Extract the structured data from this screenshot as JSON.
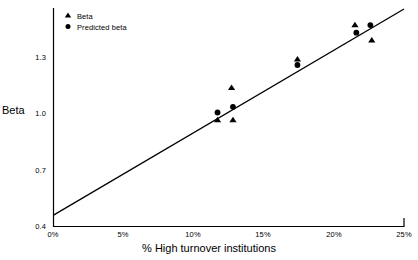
{
  "chart_data": {
    "type": "scatter",
    "title": "",
    "xlabel": "% High turnover institutions",
    "ylabel": "Beta",
    "xlim": [
      0,
      25
    ],
    "ylim": [
      0.4,
      1.55
    ],
    "grid": false,
    "legend_position": "top-left",
    "x_tick_labels": [
      "0%",
      "5%",
      "10%",
      "15%",
      "20%",
      "25%"
    ],
    "x_tick_values": [
      0,
      5,
      10,
      15,
      20,
      25
    ],
    "y_tick_labels": [
      "1.3",
      "1.0",
      "0.7",
      "0.4"
    ],
    "y_tick_values": [
      1.3,
      1.0,
      0.7,
      0.4
    ],
    "series": [
      {
        "name": "Beta",
        "marker": "triangle",
        "color": "#000000",
        "points": [
          {
            "x": 11.7,
            "y": 0.96
          },
          {
            "x": 12.8,
            "y": 0.96
          },
          {
            "x": 12.7,
            "y": 1.13
          },
          {
            "x": 17.4,
            "y": 1.28
          },
          {
            "x": 21.5,
            "y": 1.46
          },
          {
            "x": 22.7,
            "y": 1.38
          }
        ]
      },
      {
        "name": "Predicted beta",
        "marker": "circle",
        "color": "#000000",
        "points": [
          {
            "x": 11.7,
            "y": 1.0
          },
          {
            "x": 12.8,
            "y": 1.03
          },
          {
            "x": 17.4,
            "y": 1.25
          },
          {
            "x": 21.6,
            "y": 1.42
          },
          {
            "x": 22.6,
            "y": 1.46
          }
        ]
      }
    ],
    "trendline": {
      "name": "fit-line",
      "color": "#000000",
      "x_start": 0,
      "y_start": 0.46,
      "x_end": 25,
      "y_end": 1.545
    }
  },
  "legend": {
    "items": [
      {
        "label": "Beta",
        "marker": "triangle"
      },
      {
        "label": "Predicted beta",
        "marker": "circle"
      }
    ]
  },
  "axes": {
    "y_title": "Beta",
    "x_title": "% High turnover institutions",
    "y_labels": [
      "1.3",
      "1.0",
      "0.7",
      "0.4"
    ],
    "x_labels": [
      "0%",
      "5%",
      "10%",
      "15%",
      "20%",
      "25%"
    ]
  }
}
